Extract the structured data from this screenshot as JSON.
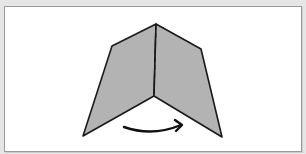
{
  "diagram": {
    "title": "",
    "colors": {
      "background": "#e6e6e6",
      "panel": "#ffffff",
      "paper_fill": "#b3b3b3",
      "outline": "#1a1a1a"
    },
    "elements": [
      {
        "name": "left-panel",
        "type": "polygon"
      },
      {
        "name": "right-panel",
        "type": "polygon"
      },
      {
        "name": "fold-line",
        "type": "dashed-line"
      },
      {
        "name": "fold-arrow",
        "type": "curved-arrow",
        "direction": "left-to-right"
      }
    ]
  }
}
